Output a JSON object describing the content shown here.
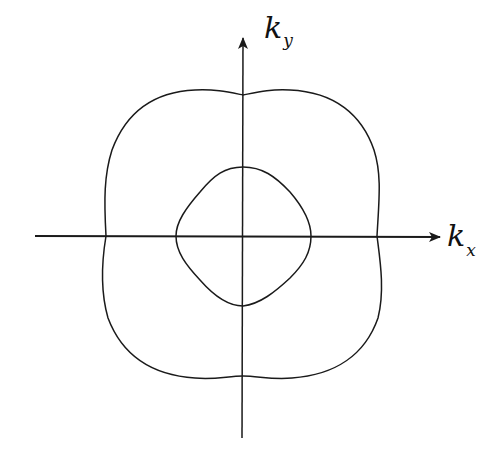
{
  "diagram": {
    "type": "reciprocal-space contour plot",
    "axes": {
      "x_label": {
        "main": "k",
        "sub": "x"
      },
      "y_label": {
        "main": "k",
        "sub": "y"
      }
    },
    "curves": [
      {
        "name": "outer-contour",
        "shape": "four-lobed rounded square"
      },
      {
        "name": "inner-contour",
        "shape": "rounded diamond"
      }
    ],
    "colors": {
      "line": "#1a1a1a",
      "background": "#ffffff"
    }
  }
}
